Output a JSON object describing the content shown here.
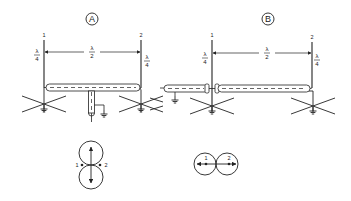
{
  "diagram": {
    "colors": {
      "line": "#222222",
      "background": "#ffffff"
    },
    "panels": [
      {
        "id": "A",
        "label": "A",
        "antenna_1_label": "1",
        "antenna_2_label": "2",
        "antenna_1_height": {
          "num": "λ",
          "den": "4"
        },
        "antenna_2_height": {
          "num": "λ",
          "den": "4"
        },
        "spacing": {
          "num": "λ",
          "den": "2"
        },
        "feed": "center-fed T coax, equal lengths (in phase)",
        "pattern": {
          "type": "figure-eight broadside",
          "left_label": "1",
          "right_label": "2",
          "orientation": "vertical lobes"
        }
      },
      {
        "id": "B",
        "label": "B",
        "antenna_1_label": "1",
        "antenna_2_label": "2",
        "antenna_1_height": {
          "num": "λ",
          "den": "4"
        },
        "antenna_2_height": {
          "num": "λ",
          "den": "4"
        },
        "spacing": {
          "num": "λ",
          "den": "2"
        },
        "feed": "end-fed coax through antenna 1 to antenna 2 (180° phase)",
        "pattern": {
          "type": "figure-eight endfire",
          "left_label": "1",
          "right_label": "2",
          "orientation": "horizontal lobes"
        }
      }
    ]
  }
}
